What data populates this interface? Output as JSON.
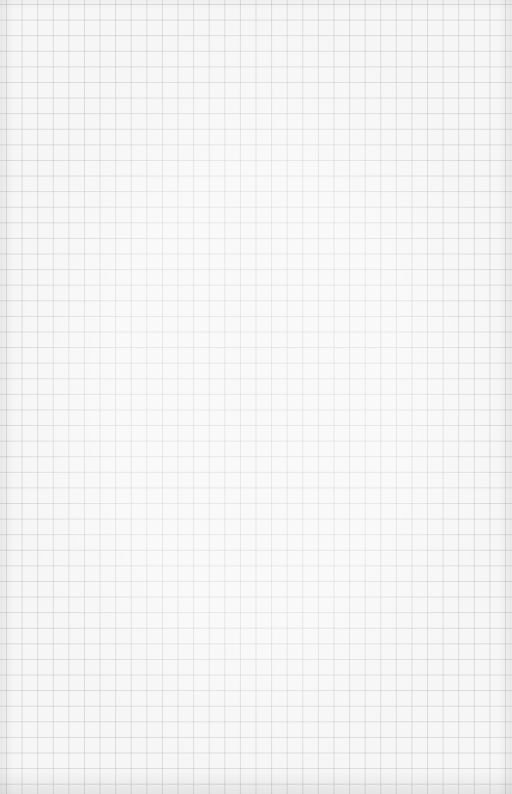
{
  "image": {
    "subject": "grid paper",
    "grid_spacing_px": 15.6,
    "colors": {
      "paper": "#f6f6f6",
      "grid_line": "#c8c8c8"
    }
  }
}
